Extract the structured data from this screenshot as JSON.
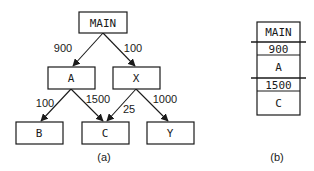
{
  "diagram_a": {
    "caption": "(a)",
    "nodes": {
      "main": "MAIN",
      "a": "A",
      "x": "X",
      "b": "B",
      "c": "C",
      "y": "Y"
    },
    "edges": [
      {
        "from": "MAIN",
        "to": "A",
        "weight": "900"
      },
      {
        "from": "MAIN",
        "to": "X",
        "weight": "100"
      },
      {
        "from": "A",
        "to": "B",
        "weight": "100"
      },
      {
        "from": "A",
        "to": "C",
        "weight": "1500"
      },
      {
        "from": "X",
        "to": "C",
        "weight": "25"
      },
      {
        "from": "X",
        "to": "Y",
        "weight": "1000"
      }
    ]
  },
  "diagram_b": {
    "caption": "(b)",
    "stack": [
      "MAIN",
      "900",
      "A",
      "1500",
      "C"
    ]
  }
}
